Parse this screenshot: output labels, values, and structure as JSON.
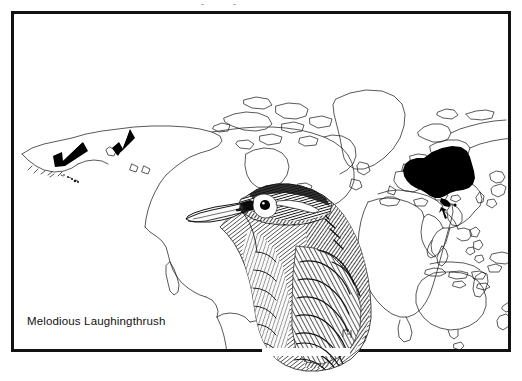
{
  "plate": {
    "caption": "Melodious Laughingthrush",
    "frame_color": "#121212",
    "background_color": "#ffffff",
    "ink_color": "#1a1a1a",
    "coastline_color": "#222222",
    "range_fill_color": "#000000"
  },
  "map": {
    "type": "world-outline-map",
    "projection": "cylindrical",
    "landmasses": [
      "North America",
      "Greenland",
      "Canadian Arctic Archipelago",
      "Central America",
      "Caribbean",
      "South America",
      "Europe",
      "Africa",
      "Asia",
      "Japan",
      "Southeast Asia",
      "Indonesia",
      "Philippines",
      "Australia",
      "New Zealand",
      "Hawaii"
    ],
    "range_blob_label": "southern China breeding range",
    "arrows": [
      {
        "name": "arrow-hawaii",
        "target": "Hawaii",
        "direction": "down-left"
      },
      {
        "name": "arrow-california",
        "target": "California / Baja",
        "direction": "down-left"
      },
      {
        "name": "arrow-southern-china",
        "target": "southern China range",
        "direction": "up-right"
      }
    ]
  },
  "illustration": {
    "subject": "Melodious Laughingthrush head and breast",
    "style": "pen-and-ink stipple hatching",
    "features": [
      "pale bill",
      "white eye-ring",
      "white postocular stripe",
      "dark crown",
      "scaled breast"
    ]
  }
}
